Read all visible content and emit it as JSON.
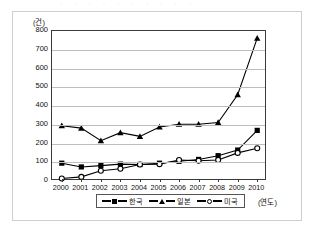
{
  "top_fragment": "· · ·   · ·   ·   ·     · · ·",
  "axis": {
    "y_unit": "(건)",
    "x_name": "(연도)",
    "y_ticks": [
      "800",
      "700",
      "600",
      "500",
      "400",
      "300",
      "200",
      "100",
      "0"
    ],
    "x_ticks": [
      "2000",
      "2001",
      "2002",
      "2003",
      "2004",
      "2005",
      "2006",
      "2007",
      "2008",
      "2009",
      "2010"
    ]
  },
  "legend": {
    "items": [
      {
        "label": "한국",
        "marker": "filled-square"
      },
      {
        "label": "일본",
        "marker": "filled-triangle"
      },
      {
        "label": "미국",
        "marker": "open-circle"
      }
    ]
  },
  "chart_data": {
    "type": "line",
    "title": "",
    "xlabel": "(연도)",
    "ylabel": "(건)",
    "ylim": [
      0,
      800
    ],
    "ytick_step": 100,
    "grid": "horizontal",
    "legend_position": "bottom",
    "categories": [
      "2000",
      "2001",
      "2002",
      "2003",
      "2004",
      "2005",
      "2006",
      "2007",
      "2008",
      "2009",
      "2010"
    ],
    "series": [
      {
        "name": "한국",
        "marker": "filled-square",
        "values": [
          95,
          75,
          82,
          90,
          88,
          95,
          105,
          115,
          135,
          165,
          270
        ]
      },
      {
        "name": "일본",
        "marker": "filled-triangle",
        "values": [
          295,
          282,
          215,
          258,
          238,
          288,
          303,
          303,
          312,
          460,
          762
        ]
      },
      {
        "name": "미국",
        "marker": "open-circle",
        "values": [
          13,
          22,
          55,
          65,
          88,
          90,
          112,
          108,
          112,
          150,
          175
        ]
      }
    ]
  }
}
